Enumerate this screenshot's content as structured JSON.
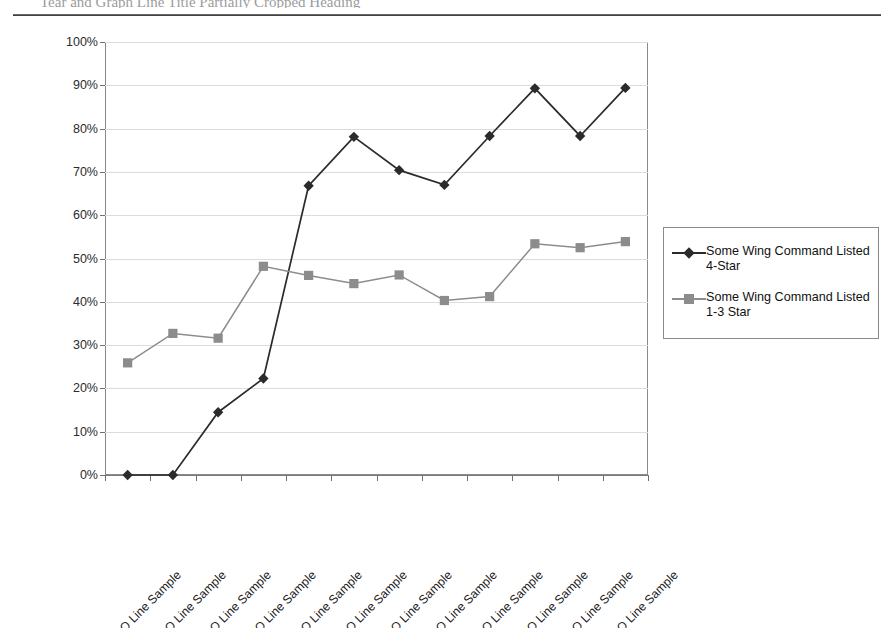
{
  "page": {
    "cropped_header_text": "Tear and Graph Line Title Partially Cropped Heading"
  },
  "legend": {
    "position": "right",
    "entries": [
      {
        "label": "Some Wing Command Listed\n4-Star",
        "marker": "diamond-marker-icon",
        "color": "#2b2b2b"
      },
      {
        "label": "Some Wing Command Listed\n1-3 Star",
        "marker": "square-marker-icon",
        "color": "#8c8c8c"
      }
    ]
  },
  "chart_data": {
    "type": "line",
    "title": "",
    "subtitle": "",
    "xlabel": "",
    "ylabel": "",
    "ylim": [
      0,
      100
    ],
    "ytick_labels": [
      "0%",
      "10%",
      "20%",
      "30%",
      "40%",
      "50%",
      "60%",
      "70%",
      "80%",
      "90%",
      "100%"
    ],
    "ytick_values": [
      0,
      10,
      20,
      30,
      40,
      50,
      60,
      70,
      80,
      90,
      100
    ],
    "grid": true,
    "legend_position": "right",
    "categories": [
      "1951 GO Line Sample",
      "1953 GO Line Sample",
      "1958 GO Line Sample",
      "1963 GO Line Sample",
      "1968 GO Line Sample",
      "1973 GO Line Sample",
      "1978 GO Line Sample",
      "1983 GO Line Sample",
      "1988 GO Line Sample",
      "1993 GO Line Sample",
      "1998 GO Line Sample",
      "2002 GO Line Sample"
    ],
    "series": [
      {
        "name": "Some Wing Command Listed 4-Star",
        "color": "#2b2b2b",
        "marker": "diamond",
        "values": [
          0.0,
          0.0,
          14.5,
          22.3,
          66.8,
          78.1,
          70.4,
          67.0,
          78.3,
          89.3,
          78.3,
          89.4
        ]
      },
      {
        "name": "Some Wing Command Listed 1-3 Star",
        "color": "#8c8c8c",
        "marker": "square",
        "values": [
          25.9,
          32.7,
          31.6,
          48.2,
          46.1,
          44.2,
          46.2,
          40.3,
          41.2,
          53.4,
          52.5,
          53.9
        ]
      }
    ]
  }
}
